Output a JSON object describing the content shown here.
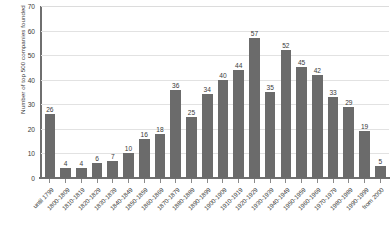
{
  "chart_data": {
    "type": "bar",
    "title": "",
    "xlabel": "",
    "ylabel": "Number of top 500 companies founded",
    "ylim": [
      0,
      70
    ],
    "ytick_step": 10,
    "yticks": [
      70,
      60,
      50,
      40,
      30,
      20,
      10,
      0
    ],
    "grid": "horizontal",
    "legend": "none",
    "bar_color": "#6b6b6b",
    "gridline_color": "#e2e2e2",
    "axis_color": "#6f6f6f",
    "text_color": "#3a3a3a",
    "categories": [
      "until 1799",
      "1800-1809",
      "1810-1819",
      "1820-1829",
      "1830-1839",
      "1840-1849",
      "1850-1859",
      "1860-1869",
      "1870-1879",
      "1880-1889",
      "1890-1899",
      "1900-1909",
      "1910-1919",
      "1920-1929",
      "1930-1939",
      "1940-1949",
      "1950-1959",
      "1960-1969",
      "1970-1979",
      "1980-1989",
      "1990-1999",
      "from 2000"
    ],
    "values": [
      26,
      4,
      4,
      6,
      7,
      10,
      16,
      18,
      36,
      25,
      34,
      40,
      44,
      57,
      35,
      52,
      45,
      42,
      33,
      29,
      19,
      5
    ]
  },
  "top_crop_fragment": "‐      ‐      ‐      ‐      ‐"
}
